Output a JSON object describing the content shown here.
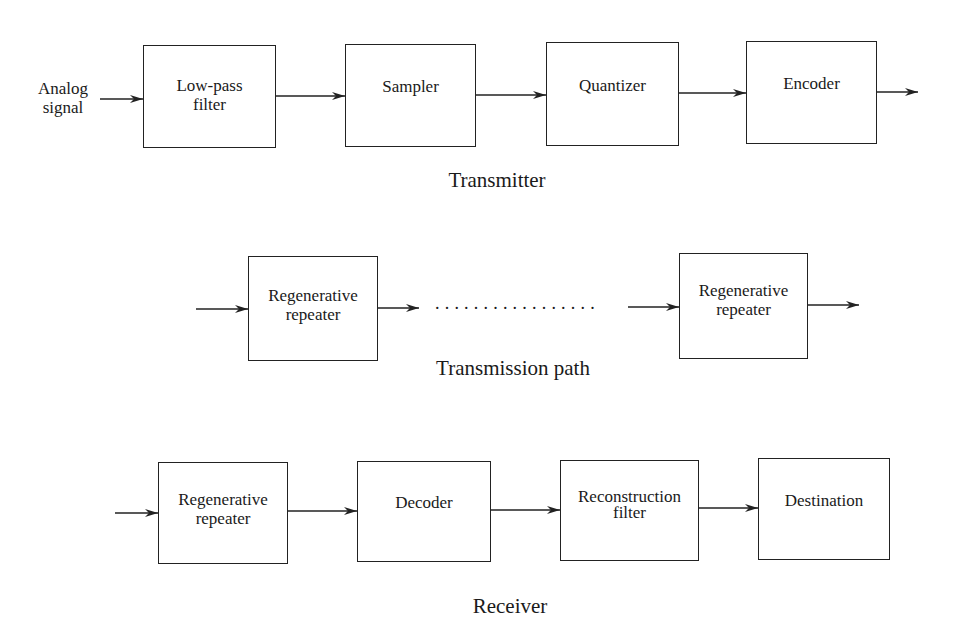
{
  "transmitter": {
    "input_label": [
      "Analog",
      "signal"
    ],
    "blocks": [
      {
        "lines": [
          "Low-pass",
          "filter"
        ]
      },
      {
        "lines": [
          "Sampler"
        ]
      },
      {
        "lines": [
          "Quantizer"
        ]
      },
      {
        "lines": [
          "Encoder"
        ]
      }
    ],
    "caption": "Transmitter"
  },
  "transmission_path": {
    "blocks": [
      {
        "lines": [
          "Regenerative",
          "repeater"
        ]
      },
      {
        "lines": [
          "Regenerative",
          "repeater"
        ]
      }
    ],
    "ellipsis": ".................",
    "caption": "Transmission path"
  },
  "receiver": {
    "blocks": [
      {
        "lines": [
          "Regenerative",
          "repeater"
        ]
      },
      {
        "lines": [
          "Decoder"
        ]
      },
      {
        "lines": [
          "Reconstruction",
          "filter"
        ]
      },
      {
        "lines": [
          "Destination"
        ]
      }
    ],
    "caption": "Receiver"
  }
}
